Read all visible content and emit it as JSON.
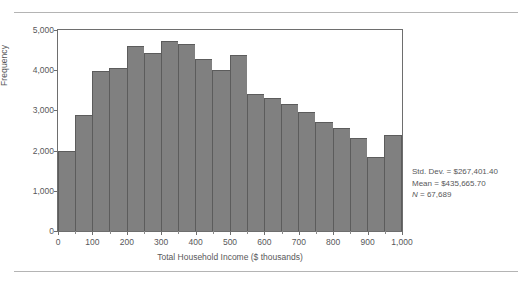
{
  "chart_data": {
    "type": "bar",
    "title": "",
    "xlabel": "Total Household Income ($ thousands)",
    "ylabel": "Frequency",
    "xlim": [
      0,
      1000
    ],
    "ylim": [
      0,
      5000
    ],
    "grid": false,
    "legend": "none",
    "bin_width": 50,
    "categories": [
      "0-50",
      "50-100",
      "100-150",
      "150-200",
      "200-250",
      "250-300",
      "300-350",
      "350-400",
      "400-450",
      "450-500",
      "500-550",
      "550-600",
      "600-650",
      "650-700",
      "700-750",
      "750-800",
      "800-850",
      "850-900",
      "900-950",
      "950-1000"
    ],
    "x": [
      25,
      75,
      125,
      175,
      225,
      275,
      325,
      375,
      425,
      475,
      525,
      575,
      625,
      675,
      725,
      775,
      825,
      875,
      925,
      975
    ],
    "values": [
      2000,
      2880,
      3970,
      4060,
      4610,
      4420,
      4730,
      4660,
      4280,
      4000,
      4370,
      3400,
      3300,
      3160,
      2950,
      2720,
      2570,
      2320,
      1830,
      1500
    ],
    "values_note": "final bar 2,400 after top-code spike",
    "values_final": [
      2000,
      2880,
      3970,
      4060,
      4610,
      4420,
      4730,
      4660,
      4280,
      4000,
      4370,
      3400,
      3300,
      3160,
      2950,
      2720,
      2570,
      2320,
      1830,
      1440
    ],
    "ytick_labels": [
      "0",
      "1,000",
      "2,000",
      "3,000",
      "4,000",
      "5,000"
    ],
    "ytick_values": [
      0,
      1000,
      2000,
      3000,
      4000,
      5000
    ],
    "xtick_labels": [
      "0",
      "100",
      "200",
      "300",
      "400",
      "500",
      "600",
      "700",
      "800",
      "900",
      "1,000"
    ],
    "xtick_values": [
      0,
      100,
      200,
      300,
      400,
      500,
      600,
      700,
      800,
      900,
      1000
    ],
    "bar_color": "#808080",
    "bar_edge_color": "#5c5c5c",
    "axis_color": "#6e6e6e",
    "text_color": "#58585a"
  },
  "bar_heights": [
    2000,
    2880,
    3970,
    4060,
    4610,
    4420,
    4730,
    4660,
    4280,
    4000,
    4370,
    3400,
    3300,
    3160,
    2950,
    2720,
    2570,
    2320,
    1830,
    1440,
    2400
  ],
  "stats": {
    "std_dev": "Std. Dev. = $267,401.40",
    "mean": "Mean = $435,665.70",
    "n_symbol": "N",
    "n_value": " = 67,689"
  }
}
